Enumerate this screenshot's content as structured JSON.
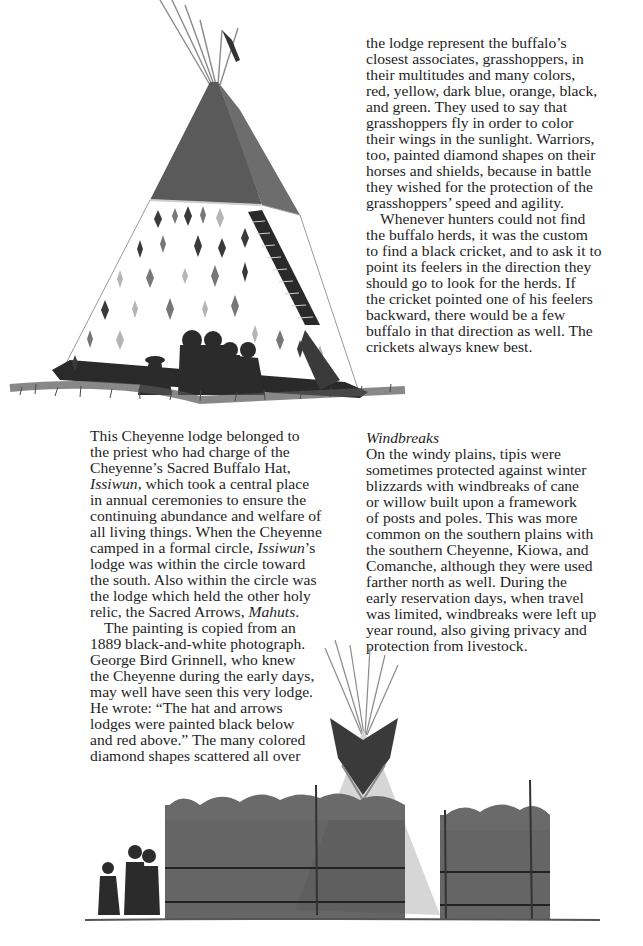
{
  "page": {
    "background": "#ffffff",
    "text_color": "#1e1e1e"
  },
  "illustrations": {
    "top": {
      "subject": "Cheyenne Sacred Buffalo Hat lodge (tipi) with red upper half, black lower band, scattered diamond shapes, and seated figures in front",
      "colors": {
        "upper": "#555555",
        "lower_band": "#2a2a2a",
        "cover": "#ffffff",
        "diamonds_dark": "#3a3a3a",
        "diamonds_mid": "#777777",
        "diamonds_light": "#b5b5b5",
        "figures": "#2b2b2b",
        "grass": "#4a4a4a"
      }
    },
    "bottom": {
      "subject": "Tipi behind cane/willow windbreak fences with three figures at left",
      "colors": {
        "tipi_cover": "#d6d6d6",
        "smoke_flaps": "#3a3a3a",
        "fence": "#3f3f3f",
        "figures": "#2b2b2b"
      }
    }
  },
  "right_column_top": {
    "lines": [
      "the lodge represent the buffalo’s",
      "closest associates, grasshoppers, in",
      "their multitudes and many colors,",
      "red, yellow, dark blue, orange, black,",
      "and green. They used to say that",
      "grasshoppers fly in order to color",
      "their wings in the sunlight. Warriors,",
      "too, painted diamond shapes on their",
      "horses and shields, because in battle",
      "they wished for the protection of the",
      "grasshoppers’ speed and agility."
    ],
    "para2_lines": [
      "Whenever hunters could not find",
      "the buffalo herds, it was the custom",
      "to find a black cricket, and to ask it to",
      "point its feelers in the direction they",
      "should go to look for the herds. If",
      "the cricket pointed one of his feelers",
      "backward, there would be a few",
      "buffalo in that direction as well. The",
      "crickets always knew best."
    ]
  },
  "left_column": {
    "para1": {
      "l1": "This Cheyenne lodge belonged to",
      "l2": "the priest who had charge of the",
      "l3": "Cheyenne’s Sacred Buffalo Hat,",
      "l4_italic": "Issiwun",
      "l4_rest": ", which took a central place",
      "l5": "in annual ceremonies to ensure the",
      "l6": "continuing abundance and welfare of",
      "l7": "all living things. When the Cheyenne",
      "l8_pre": "camped in a formal circle, ",
      "l8_italic": "Issiwun",
      "l8_post": "’s",
      "l9": "lodge was within the circle toward",
      "l10": "the south. Also within the circle was",
      "l11": "the lodge which held the other holy",
      "l12_pre": "relic, the Sacred Arrows, ",
      "l12_italic": "Mahuts",
      "l12_post": "."
    },
    "para2_lines": [
      "The painting is copied from an",
      "1889 black-and-white photograph.",
      "George Bird Grinnell, who knew",
      "the Cheyenne during the early days,",
      "may well have seen this very lodge.",
      "He wrote: “The hat and arrows",
      "lodges were painted black below",
      "and red above.” The many colored",
      "diamond shapes scattered all over"
    ]
  },
  "right_column_bottom": {
    "heading": "Windbreaks",
    "lines": [
      "On the windy plains, tipis were",
      "sometimes protected against winter",
      "blizzards with windbreaks of cane",
      "or willow built upon a framework",
      "of posts and poles. This was more",
      "common on the southern plains with",
      "the southern Cheyenne, Kiowa, and",
      "Comanche, although they were used",
      "farther north as well. During the",
      "early reservation days, when travel",
      "was limited, windbreaks were left up",
      "year round, also giving privacy and",
      "protection from livestock."
    ]
  }
}
